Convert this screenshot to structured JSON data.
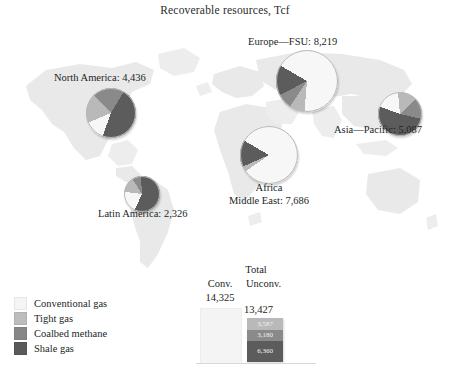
{
  "chart_data": {
    "type": "pie",
    "title": "Recoverable resources, Tcf",
    "unit": "Tcf",
    "categories": [
      "Conventional gas",
      "Tight gas",
      "Coalbed methane",
      "Shale gas"
    ],
    "colors": {
      "conventional": "#f7f7f7",
      "tight": "#b9b9b9",
      "coalbed": "#8a8a8a",
      "shale": "#5c5c5c",
      "map_land": "#e9e9e9",
      "text": "#231f20"
    },
    "regions": [
      {
        "name": "North America",
        "label": "North America: 4,436",
        "total": 4436,
        "shares": {
          "conventional": 13,
          "tight": 19,
          "coalbed": 21,
          "shale": 47
        }
      },
      {
        "name": "Latin America",
        "label": "Latin America: 2,326",
        "total": 2326,
        "shares": {
          "conventional": 20,
          "tight": 14,
          "coalbed": 8,
          "shale": 58
        }
      },
      {
        "name": "Europe-FSU",
        "label": "Europe—FSU: 8,219",
        "total": 8219,
        "shares": {
          "conventional": 68,
          "tight": 8,
          "coalbed": 8,
          "shale": 16
        }
      },
      {
        "name": "Africa Middle East",
        "label_line1": "Africa",
        "label_line2": "Middle East: 7,686",
        "total": 7686,
        "shares": {
          "conventional": 82,
          "tight": 3,
          "coalbed": 0,
          "shale": 15
        }
      },
      {
        "name": "Asia-Pacific",
        "label": "Asia—Pacific: 5,087",
        "total": 5087,
        "shares": {
          "conventional": 18,
          "tight": 14,
          "coalbed": 16,
          "shale": 52
        }
      }
    ],
    "totals": {
      "heading": "Total",
      "conventional_label": "Conv.",
      "unconventional_label": "Unconv.",
      "conventional_value": "14,325",
      "unconventional_value": "13,427",
      "unconventional_segments": [
        {
          "name": "Tight gas",
          "value": "3,587",
          "number": 3587
        },
        {
          "name": "Coalbed methane",
          "value": "3,180",
          "number": 3180
        },
        {
          "name": "Shale gas",
          "value": "6,360",
          "number": 6360
        }
      ]
    }
  },
  "legend": {
    "items": [
      {
        "label": "Conventional gas",
        "color": "#f5f5f5"
      },
      {
        "label": "Tight gas",
        "color": "#bdbdbd"
      },
      {
        "label": "Coalbed methane",
        "color": "#878787"
      },
      {
        "label": "Shale gas",
        "color": "#5a5a5a"
      }
    ]
  }
}
